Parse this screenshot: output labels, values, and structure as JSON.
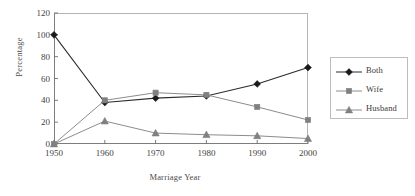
{
  "chart_data": {
    "type": "line",
    "title": "",
    "xlabel": "Marriage Year",
    "ylabel": "Percentage",
    "x": [
      1950,
      1960,
      1970,
      1980,
      1990,
      2000
    ],
    "categories": [
      "1950",
      "1960",
      "1970",
      "1980",
      "1990",
      "2000"
    ],
    "xlim": [
      1950,
      2000
    ],
    "ylim": [
      0,
      120
    ],
    "yticks": [
      0,
      20,
      40,
      60,
      80,
      100,
      120
    ],
    "ytick_labels": [
      "0",
      "20",
      "40",
      "60",
      "80",
      "100",
      "120"
    ],
    "xtick_labels": [
      "1950",
      "1960",
      "1970",
      "1980",
      "1990",
      "2000"
    ],
    "grid": false,
    "legend_position": "right",
    "series": [
      {
        "name": "Both",
        "marker": "diamond",
        "color": "#1a1a1a",
        "line_color": "#2b2b2b",
        "values": [
          100,
          38,
          42,
          44,
          55,
          70
        ]
      },
      {
        "name": "Wife",
        "marker": "square",
        "color": "#808080",
        "line_color": "#8c8c8c",
        "values": [
          0,
          40,
          47,
          45,
          34,
          22
        ]
      },
      {
        "name": "Husband",
        "marker": "triangle",
        "color": "#808080",
        "line_color": "#8c8c8c",
        "values": [
          0,
          21,
          10,
          8.5,
          7.5,
          5
        ]
      }
    ]
  },
  "legend": {
    "items": [
      {
        "label": "Both"
      },
      {
        "label": "Wife"
      },
      {
        "label": "Husband"
      }
    ]
  },
  "axes": {
    "y_title": "Percentage",
    "x_title": "Marriage Year"
  }
}
